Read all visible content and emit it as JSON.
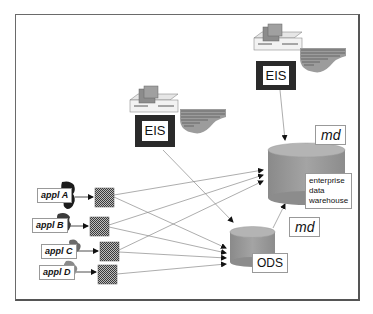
{
  "diagram": {
    "eis_terminals": [
      {
        "id": "eis-top-right",
        "label": "EIS"
      },
      {
        "id": "eis-middle",
        "label": "EIS"
      }
    ],
    "stores": {
      "warehouse": {
        "label": "enterprise\ndata\nwarehouse",
        "metadata_label": "md"
      },
      "ods": {
        "label": "ODS",
        "metadata_label": "md"
      }
    },
    "applications": [
      {
        "label": "appl A"
      },
      {
        "label": "appl B"
      },
      {
        "label": "appl C"
      },
      {
        "label": "appl D"
      }
    ],
    "flows": [
      {
        "from": "appl A",
        "to": "warehouse"
      },
      {
        "from": "appl A",
        "to": "ODS"
      },
      {
        "from": "appl B",
        "to": "warehouse"
      },
      {
        "from": "appl B",
        "to": "ODS"
      },
      {
        "from": "appl C",
        "to": "warehouse"
      },
      {
        "from": "appl C",
        "to": "ODS"
      },
      {
        "from": "appl D",
        "to": "ODS"
      },
      {
        "from": "ODS",
        "to": "warehouse"
      },
      {
        "from": "EIS (top right)",
        "to": "warehouse"
      },
      {
        "from": "EIS (middle)",
        "to": "ODS"
      }
    ],
    "colors": {
      "cylinder_body": "#9a9a9a",
      "cylinder_top": "#b4b4b4",
      "eis_frame": "#2a2a2a",
      "line": "#8a8a8a",
      "arrowhead": "#111111"
    }
  }
}
